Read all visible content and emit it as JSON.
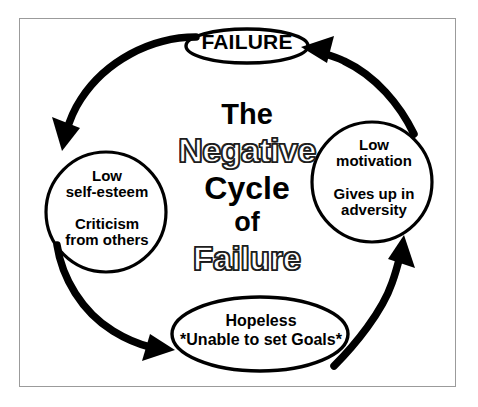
{
  "diagram": {
    "title_block": {
      "lines": [
        {
          "text": "The",
          "style": "solid"
        },
        {
          "text": "Negative",
          "style": "outline"
        },
        {
          "text": "Cycle",
          "style": "solid"
        },
        {
          "text": "of",
          "style": "solid"
        },
        {
          "text": "Failure",
          "style": "outline"
        }
      ],
      "full_title": "The Negative Cycle of Failure"
    },
    "nodes": {
      "failure": {
        "shape": "ellipse",
        "label": "FAILURE"
      },
      "left": {
        "shape": "circle",
        "line1": "Low\nself-esteem",
        "line2": "Criticism\nfrom others"
      },
      "right": {
        "shape": "circle",
        "line1": "Low\nmotivation",
        "line2": "Gives up in\nadversity"
      },
      "bottom": {
        "shape": "ellipse",
        "line1": "Hopeless",
        "line2": "*Unable to set Goals*"
      }
    },
    "arrows": [
      {
        "id": "failure-to-left",
        "from": "failure",
        "to": "left",
        "direction": "counter-clockwise"
      },
      {
        "id": "left-to-bottom",
        "from": "left",
        "to": "bottom",
        "direction": "counter-clockwise"
      },
      {
        "id": "bottom-to-right",
        "from": "bottom",
        "to": "right",
        "direction": "counter-clockwise"
      },
      {
        "id": "right-to-failure",
        "from": "right",
        "to": "failure",
        "direction": "counter-clockwise"
      }
    ],
    "colors": {
      "ink": "#000000",
      "background": "#ffffff",
      "frame_border": "#9b9b9b",
      "outline_text_fill": "#ffffff",
      "outline_text_stroke": "#2b2b2b"
    }
  }
}
